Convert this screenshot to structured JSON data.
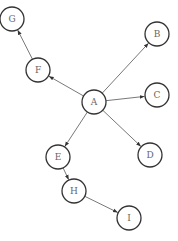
{
  "diagram": {
    "type": "directed-graph",
    "node_radius": 12,
    "colors": {
      "node_stroke": "#333333",
      "node_fill": "#ffffff",
      "label": "#666666",
      "edge": "#555555"
    },
    "nodes": [
      {
        "id": "A",
        "label": "A",
        "x": 94,
        "y": 102
      },
      {
        "id": "B",
        "label": "B",
        "x": 157,
        "y": 34
      },
      {
        "id": "C",
        "label": "C",
        "x": 157,
        "y": 95
      },
      {
        "id": "D",
        "label": "D",
        "x": 150,
        "y": 155
      },
      {
        "id": "E",
        "label": "E",
        "x": 58,
        "y": 157
      },
      {
        "id": "F",
        "label": "F",
        "x": 38,
        "y": 70
      },
      {
        "id": "G",
        "label": "G",
        "x": 12,
        "y": 19
      },
      {
        "id": "H",
        "label": "H",
        "x": 74,
        "y": 191
      },
      {
        "id": "I",
        "label": "I",
        "x": 129,
        "y": 218
      }
    ],
    "edges": [
      {
        "from": "A",
        "to": "B"
      },
      {
        "from": "A",
        "to": "C"
      },
      {
        "from": "A",
        "to": "D"
      },
      {
        "from": "A",
        "to": "E"
      },
      {
        "from": "A",
        "to": "F"
      },
      {
        "from": "F",
        "to": "G"
      },
      {
        "from": "E",
        "to": "H"
      },
      {
        "from": "H",
        "to": "I"
      }
    ]
  }
}
